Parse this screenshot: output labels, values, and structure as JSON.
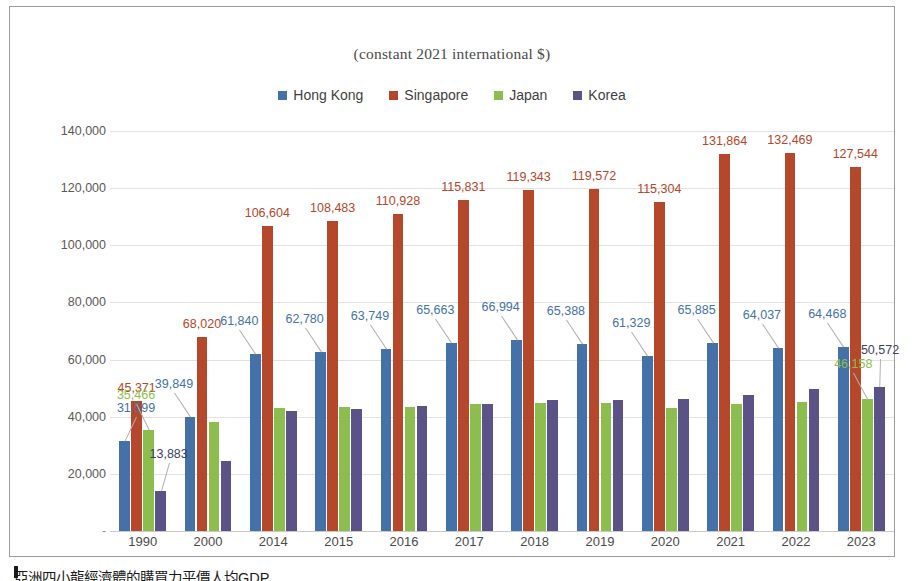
{
  "chart_data": {
    "type": "bar",
    "title": "(constant 2021 international $)",
    "xlabel": "",
    "ylabel": "",
    "ylim": [
      0,
      140000
    ],
    "ytick_interval": 20000,
    "ytick_labels": [
      "-",
      "20,000",
      "40,000",
      "60,000",
      "80,000",
      "100,000",
      "120,000",
      "140,000"
    ],
    "ytick_values": [
      0,
      20000,
      40000,
      60000,
      80000,
      100000,
      120000,
      140000
    ],
    "grid": true,
    "legend_position": "top",
    "categories": [
      "1990",
      "2000",
      "2014",
      "2015",
      "2016",
      "2017",
      "2018",
      "2019",
      "2020",
      "2021",
      "2022",
      "2023"
    ],
    "series": [
      {
        "name": "Hong Kong",
        "color": "#4472A8",
        "values": [
          31599,
          39849,
          61840,
          62780,
          63749,
          65663,
          66994,
          65388,
          61329,
          65885,
          64037,
          64468
        ],
        "labels": [
          "31,599",
          "39,849",
          "61,840",
          "62,780",
          "63,749",
          "65,663",
          "66,994",
          "65,388",
          "61,329",
          "65,885",
          "64,037",
          "64,468"
        ]
      },
      {
        "name": "Singapore",
        "color": "#B5472A",
        "values": [
          45371,
          68020,
          106604,
          108483,
          110928,
          115831,
          119343,
          119572,
          115304,
          131864,
          132469,
          127544
        ],
        "labels": [
          "45,371",
          "68,020",
          "106,604",
          "108,483",
          "110,928",
          "115,831",
          "119,343",
          "119,572",
          "115,304",
          "131,864",
          "132,469",
          "127,544"
        ]
      },
      {
        "name": "Japan",
        "color": "#8CBE4F",
        "values": [
          35466,
          38200,
          42900,
          43300,
          43500,
          44500,
          44900,
          44700,
          43000,
          44300,
          45000,
          46158
        ],
        "labels": [
          "35,466",
          "",
          "",
          "",
          "",
          "",
          "",
          "",
          "",
          "",
          "",
          "46,158"
        ]
      },
      {
        "name": "Korea",
        "color": "#5B5288",
        "values": [
          13883,
          24600,
          41900,
          42600,
          43600,
          44600,
          45900,
          45700,
          46200,
          47600,
          49700,
          50572
        ],
        "labels": [
          "13,883",
          "",
          "",
          "",
          "",
          "",
          "",
          "",
          "",
          "",
          "",
          "50,572"
        ]
      }
    ]
  },
  "footer": {
    "note": "亞洲四小龍經濟體的購買力平價人均GDP"
  }
}
